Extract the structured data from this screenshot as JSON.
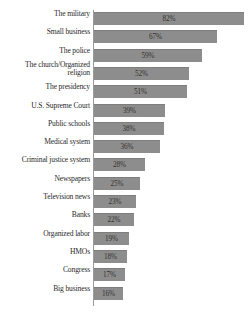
{
  "chart_data": {
    "type": "bar",
    "orientation": "horizontal",
    "title": "",
    "subtitle": "",
    "xlabel": "",
    "ylabel": "",
    "xlim": [
      0,
      82
    ],
    "grid": false,
    "legend": null,
    "value_suffix": "%",
    "bar_color": "#8d8d8d",
    "bar_border_color": "#7e7e7e",
    "axis_color": "#9a9a9a",
    "label_color": "#2b2b2b",
    "value_label_color": "#33312f",
    "background": "#ffffff",
    "categories": [
      "The military",
      "Small business",
      "The police",
      "The church/Organized religion",
      "The presidency",
      "U.S. Supreme Court",
      "Public schools",
      "Medical system",
      "Criminal justice system",
      "Newspapers",
      "Television news",
      "Banks",
      "Organized labor",
      "HMOs",
      "Congress",
      "Big business"
    ],
    "values": [
      82,
      67,
      59,
      52,
      51,
      39,
      38,
      36,
      28,
      25,
      23,
      22,
      19,
      18,
      17,
      16
    ],
    "data_labels": [
      "82%",
      "67%",
      "59%",
      "52%",
      "51%",
      "39%",
      "38%",
      "36%",
      "28%",
      "25%",
      "23%",
      "22%",
      "19%",
      "18%",
      "17%",
      "16%"
    ]
  }
}
